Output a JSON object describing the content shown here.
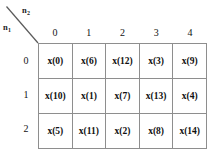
{
  "figure": {
    "corner": {
      "row_axis_label": "n",
      "row_axis_sub": "1",
      "col_axis_label": "n",
      "col_axis_sub": "2",
      "divider": "diagonal-line"
    },
    "column_headers": [
      "0",
      "1",
      "2",
      "3",
      "4"
    ],
    "row_headers": [
      "0",
      "1",
      "2"
    ],
    "cells": [
      [
        "x(0)",
        "x(6)",
        "x(12)",
        "x(3)",
        "x(9)"
      ],
      [
        "x(10)",
        "x(1)",
        "x(7)",
        "x(13)",
        "x(4)"
      ],
      [
        "x(5)",
        "x(11)",
        "x(2)",
        "x(8)",
        "x(14)"
      ]
    ],
    "colors": {
      "background": "#ffffff",
      "grid_line": "#8e8e8e",
      "text": "#101010",
      "diagonal_line": "#5a5a5a"
    }
  }
}
